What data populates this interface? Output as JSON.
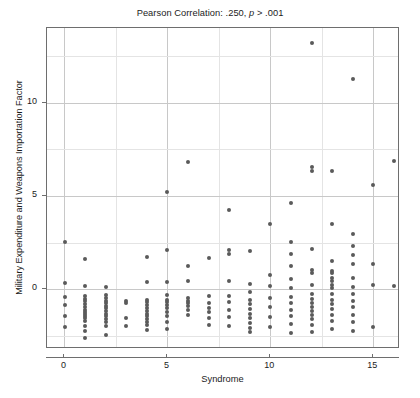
{
  "chart_data": {
    "type": "scatter",
    "title": "Pearson Correlation: .250, p > .001",
    "title_parts": {
      "pre": "Pearson Correlation: .250, ",
      "italic": "p",
      "post": " > .001"
    },
    "xlabel": "Syndrome",
    "ylabel": "Military Expenditure and Weapons Importation Factor",
    "xlim": [
      -0.85,
      16.3
    ],
    "ylim": [
      -3.2,
      14.0
    ],
    "xticks": [
      0,
      5,
      10,
      15
    ],
    "xtick_labels": [
      "0",
      "5",
      "10",
      "15"
    ],
    "yticks": [
      0,
      5,
      10
    ],
    "ytick_labels": [
      "0",
      "5",
      "10"
    ],
    "grid": true,
    "grid_major_x": [
      0,
      2.5,
      5,
      7.5,
      10,
      12.5,
      15
    ],
    "grid_major_y": [
      -2.5,
      0,
      2.5,
      5,
      7.5,
      10,
      12.5
    ],
    "marker_color": "#5a5a5a",
    "marker_size": 4,
    "frame_color": "#6e6e6e",
    "grid_color": "#c8c8c8",
    "background": "#ffffff",
    "pearson_r": 0.25,
    "p_text": "> .001",
    "x": [
      0,
      0,
      0,
      0,
      0,
      0,
      1,
      1,
      1,
      1,
      1,
      1,
      1,
      1,
      1,
      1,
      1,
      1,
      1,
      1,
      1,
      1,
      2,
      2,
      2,
      2,
      2,
      2,
      2,
      2,
      2,
      2,
      2,
      2,
      2,
      2,
      3,
      3,
      3,
      3,
      4,
      4,
      4,
      4,
      4,
      4,
      4,
      4,
      4,
      4,
      4,
      4,
      4,
      5,
      5,
      5,
      5,
      5,
      5,
      5,
      5,
      5,
      5,
      5,
      5,
      6,
      6,
      6,
      6,
      6,
      6,
      6,
      6,
      6,
      7,
      7,
      7,
      7,
      7,
      7,
      7,
      8,
      8,
      8,
      8,
      8,
      8,
      8,
      8,
      8,
      9,
      9,
      9,
      9,
      9,
      9,
      9,
      9,
      9,
      9,
      9,
      10,
      10,
      10,
      10,
      10,
      10,
      10,
      11,
      11,
      11,
      11,
      11,
      11,
      11,
      11,
      11,
      11,
      11,
      11,
      12,
      12,
      12,
      12,
      12,
      12,
      12,
      12,
      12,
      12,
      12,
      12,
      12,
      12,
      12,
      12,
      13,
      13,
      13,
      13,
      13,
      13,
      13,
      13,
      13,
      13,
      13,
      13,
      13,
      13,
      13,
      13,
      14,
      14,
      14,
      14,
      14,
      14,
      14,
      14,
      14,
      14,
      14,
      14,
      14,
      15,
      15,
      15,
      15,
      16,
      16
    ],
    "y": [
      2.55,
      0.35,
      -0.4,
      -0.85,
      -1.45,
      -2.0,
      1.6,
      0.2,
      -0.35,
      -0.5,
      -0.65,
      -0.8,
      -0.95,
      -1.1,
      -1.2,
      -1.3,
      -1.45,
      -1.55,
      -1.7,
      -1.95,
      -2.25,
      -2.6,
      0.15,
      -0.3,
      -0.45,
      -0.6,
      -0.75,
      -0.9,
      -1.0,
      -1.15,
      -1.3,
      -1.45,
      -1.6,
      -1.75,
      -1.95,
      -2.45,
      -0.6,
      -0.75,
      -1.55,
      -1.95,
      1.75,
      0.4,
      -0.55,
      -0.7,
      -0.85,
      -1.0,
      -1.15,
      -1.3,
      -1.45,
      -1.6,
      -1.75,
      -1.9,
      -2.2,
      5.2,
      2.1,
      0.4,
      -0.3,
      -0.55,
      -0.7,
      -0.85,
      -1.0,
      -1.2,
      -1.45,
      -1.75,
      -2.1,
      6.8,
      1.25,
      0.45,
      -0.45,
      -0.6,
      -0.75,
      -0.9,
      -1.1,
      -1.35,
      1.7,
      -0.35,
      -0.75,
      -1.0,
      -1.2,
      -1.55,
      -1.9,
      4.25,
      2.1,
      1.9,
      0.45,
      -0.35,
      -0.7,
      -1.1,
      -1.5,
      -1.95,
      2.05,
      0.3,
      -0.15,
      -0.55,
      -0.8,
      -1.05,
      -1.3,
      -1.55,
      -1.8,
      -2.05,
      -2.3,
      3.5,
      0.75,
      0.2,
      -0.45,
      -0.95,
      -1.5,
      -2.0,
      4.6,
      2.55,
      1.9,
      1.25,
      0.55,
      0.05,
      -0.4,
      -0.75,
      -1.1,
      -1.45,
      -1.85,
      -2.35,
      13.2,
      6.55,
      6.35,
      2.15,
      1.05,
      0.85,
      0.25,
      -0.25,
      -0.5,
      -0.75,
      -0.95,
      -1.15,
      -1.35,
      -1.6,
      -1.9,
      -2.3,
      6.35,
      3.5,
      1.5,
      1.0,
      0.9,
      0.6,
      0.45,
      0.25,
      0.05,
      -0.25,
      -0.55,
      -0.8,
      -1.05,
      -1.35,
      -1.7,
      -2.15,
      11.25,
      2.95,
      2.3,
      1.85,
      1.35,
      0.6,
      0.15,
      -0.25,
      -0.6,
      -0.95,
      -1.35,
      -1.75,
      -2.25,
      5.6,
      1.35,
      0.25,
      -2.0,
      6.85,
      0.2
    ]
  }
}
